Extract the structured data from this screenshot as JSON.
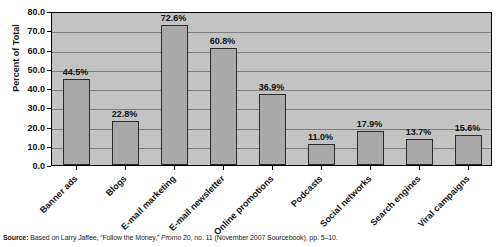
{
  "chart_data": {
    "type": "bar",
    "title": "",
    "subtitle": "",
    "xlabel": "",
    "ylabel": "Percent of Total",
    "ylim": [
      0.0,
      80.0
    ],
    "ytick_step": 10.0,
    "grid": true,
    "legend": "none",
    "categories": [
      "Banner ads",
      "Blogs",
      "E-mail marketing",
      "E-mail newsletter",
      "Online promotions",
      "Podcasts",
      "Social networks",
      "Search engines",
      "Viral campaigns"
    ],
    "values": [
      44.5,
      22.8,
      72.6,
      60.8,
      36.9,
      11.0,
      17.9,
      13.7,
      15.6
    ],
    "data_labels": [
      "44.5%",
      "22.8%",
      "72.6%",
      "60.8%",
      "36.9%",
      "11.0%",
      "17.9%",
      "13.7%",
      "15.6%"
    ],
    "ytick_labels": [
      "0.0",
      "10.0",
      "20.0",
      "30.0",
      "40.0",
      "50.0",
      "60.0",
      "70.0",
      "80.0"
    ],
    "ytick_values": [
      0.0,
      10.0,
      20.0,
      30.0,
      40.0,
      50.0,
      60.0,
      70.0,
      80.0
    ],
    "colors": {
      "bar_fill": "#a9a9a9",
      "bar_border": "#2b2b2b",
      "plot_background": "#c3c3c3",
      "gridline": "#7d7d7d",
      "axis": "#000000",
      "text": "#111111"
    }
  },
  "source": {
    "label": "Source:",
    "text_before_italic": " Based on Larry Jaffee, “Follow the Money,” ",
    "italic": "Promo",
    "text_after_italic": " 20, no. 11 (November 2007 Sourcebook), pp. 5–10."
  }
}
